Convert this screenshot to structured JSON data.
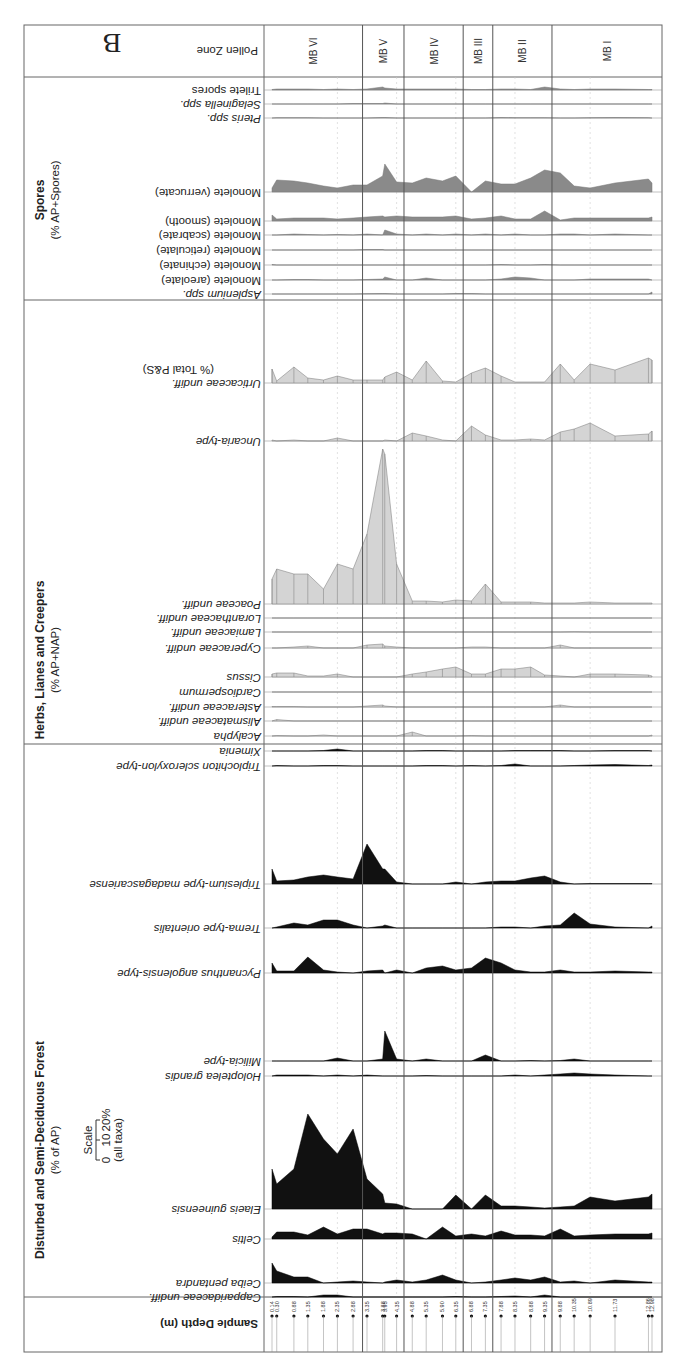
{
  "chart_data": {
    "type": "area",
    "title": "B",
    "subtitle": "Pollen diagram (rendered rotated 180°)",
    "xlabel": "Sample Depth (m)",
    "ylabel": "% abundance",
    "header_label": "Pollen Zone",
    "scale": {
      "label": "Scale",
      "ticks": [
        "0",
        "10",
        "20%"
      ],
      "note": "(all taxa)"
    },
    "depths": [
      0.14,
      0.3,
      0.88,
      1.35,
      1.88,
      2.35,
      2.88,
      3.35,
      3.88,
      3.95,
      4.35,
      4.88,
      5.35,
      5.9,
      6.35,
      6.88,
      7.35,
      7.88,
      8.35,
      8.88,
      9.35,
      9.88,
      10.35,
      10.89,
      11.73,
      12.86,
      12.98
    ],
    "depth_labels": [
      "0.14",
      "0.30",
      "0.88",
      "1.35",
      "1.88",
      "2.35",
      "2.88",
      "3.35",
      "3.88",
      "3.95",
      "4.35",
      "4.88",
      "5.35",
      "5.90",
      "6.35",
      "6.88",
      "7.35",
      "7.88",
      "8.35",
      "8.88",
      "9.35",
      "9.88",
      "10.35",
      "10.89",
      "11.73",
      "12.86",
      "12.98"
    ],
    "zones": [
      {
        "name": "MB VI",
        "from": 0.0,
        "to": 3.2
      },
      {
        "name": "MB V",
        "from": 3.2,
        "to": 4.6
      },
      {
        "name": "MB IV",
        "from": 4.6,
        "to": 6.6
      },
      {
        "name": "MB III",
        "from": 6.6,
        "to": 7.6
      },
      {
        "name": "MB II",
        "from": 7.6,
        "to": 9.6
      },
      {
        "name": "MB I",
        "from": 9.6,
        "to": 13.2
      }
    ],
    "groups": [
      {
        "name": "Spores",
        "basis": "(% AP+Spores)",
        "color": "#8a8a8a"
      },
      {
        "name": "Herbs, Lianes and Creepers",
        "basis": "(% AP+NAP)",
        "color": "#d4d4d4"
      },
      {
        "name": "Disturbed and Semi-Deciduous Forest",
        "basis": "(% of AP)",
        "color": "#111111"
      }
    ],
    "series": [
      {
        "name": "Trilete spores",
        "group": 0,
        "italic": false,
        "baseline": 90,
        "values": [
          0.5,
          1,
          1,
          1,
          0.5,
          1,
          0.5,
          1,
          3,
          2,
          1,
          1,
          1,
          1,
          1,
          0.5,
          0.5,
          1,
          1,
          0.5,
          3,
          1,
          0.5,
          1,
          1,
          0.5,
          0.5
        ]
      },
      {
        "name": "Selaginella spp.",
        "group": 0,
        "italic": true,
        "baseline": 104,
        "values": [
          0,
          0,
          0,
          0,
          0,
          0,
          0.5,
          0.5,
          0.5,
          1,
          0,
          0,
          0,
          0,
          0,
          0,
          0,
          0,
          0,
          0,
          0,
          0,
          0,
          0,
          0,
          0,
          0
        ]
      },
      {
        "name": "Pteris spp.",
        "group": 0,
        "italic": true,
        "baseline": 118,
        "values": [
          0,
          0.3,
          0.3,
          0.3,
          0,
          0,
          0,
          0,
          0.5,
          0.5,
          0,
          0,
          0,
          0,
          0,
          0,
          0,
          0.5,
          0.3,
          0.3,
          0.3,
          0,
          0,
          0.3,
          0.5,
          0.3,
          0
        ]
      },
      {
        "name": "Monolete (verrucate)",
        "group": 0,
        "italic": false,
        "baseline": 192,
        "values": [
          4,
          12,
          11,
          9,
          6,
          4,
          7,
          7,
          16,
          28,
          10,
          9,
          14,
          11,
          16,
          0,
          11,
          8,
          8,
          14,
          22,
          19,
          6,
          4,
          9,
          13,
          9
        ]
      },
      {
        "name": "Monolete (smooth)",
        "group": 0,
        "italic": false,
        "baseline": 221,
        "values": [
          6,
          2,
          3,
          3,
          3,
          2,
          3,
          4,
          5,
          4,
          5,
          4,
          4,
          4,
          5,
          2,
          3,
          5,
          2,
          2,
          10,
          1,
          3,
          3,
          3,
          3,
          4
        ]
      },
      {
        "name": "Monolete (scabrate)",
        "group": 0,
        "italic": false,
        "baseline": 235,
        "values": [
          0,
          0,
          1,
          0.5,
          0,
          0.5,
          0,
          1,
          0,
          5,
          1,
          0,
          1,
          0,
          1,
          0,
          1,
          0,
          1,
          0,
          0,
          1,
          1,
          0,
          1,
          0,
          0
        ]
      },
      {
        "name": "Monolete (reticulate)",
        "group": 0,
        "italic": false,
        "baseline": 250,
        "values": [
          0,
          0,
          0,
          0,
          0,
          0,
          0,
          0.5,
          0.5,
          0,
          0,
          0,
          0,
          0,
          0,
          0,
          0,
          0,
          0,
          0,
          0,
          0,
          0,
          0,
          0,
          0,
          0
        ]
      },
      {
        "name": "Monolete (echinate)",
        "group": 0,
        "italic": false,
        "baseline": 265,
        "values": [
          0.5,
          0,
          0,
          0,
          0,
          0,
          0,
          0,
          0,
          0,
          0,
          0,
          0,
          0,
          0,
          0,
          0,
          0.5,
          0,
          0,
          0.5,
          0,
          0,
          0,
          0,
          0,
          0
        ]
      },
      {
        "name": "Monolete (areolate)",
        "group": 0,
        "italic": false,
        "baseline": 280,
        "values": [
          0,
          0,
          0.5,
          0.5,
          0,
          0,
          0,
          0.5,
          1,
          3,
          0,
          0,
          2,
          0,
          0,
          0,
          0,
          1,
          3,
          2,
          0,
          0,
          0,
          1,
          1,
          1,
          0
        ]
      },
      {
        "name": "Asplenium spp.",
        "group": 0,
        "italic": true,
        "baseline": 294,
        "values": [
          0,
          0,
          0,
          0,
          0,
          0,
          0,
          0.3,
          0.5,
          0.5,
          0,
          0,
          0,
          0,
          0.5,
          0.5,
          0,
          0,
          0,
          0,
          0,
          0,
          0,
          0,
          0,
          0,
          2
        ]
      },
      {
        "name": "Urticaceae undiff.",
        "group": 1,
        "italic": true,
        "basis": "(% Total P&S)",
        "baseline": 383,
        "values": [
          14,
          2,
          16,
          5,
          3,
          7,
          3,
          3,
          3,
          6,
          11,
          3,
          22,
          2,
          1,
          10,
          15,
          7,
          1,
          1,
          1,
          19,
          3,
          19,
          13,
          25,
          23
        ]
      },
      {
        "name": "Uncaria-type",
        "group": 1,
        "italic": true,
        "baseline": 441,
        "values": [
          1,
          0,
          1,
          0,
          0,
          3,
          0,
          0,
          0,
          1,
          0,
          8,
          5,
          1,
          0,
          15,
          6,
          1,
          1,
          2,
          1,
          9,
          12,
          18,
          5,
          7,
          10
        ]
      },
      {
        "name": "Poaceae undiff.",
        "group": 1,
        "italic": true,
        "baseline": 604,
        "values": [
          25,
          35,
          30,
          30,
          15,
          40,
          35,
          70,
          155,
          150,
          40,
          3,
          3,
          2,
          4,
          3,
          20,
          2,
          2,
          2,
          1,
          1,
          1,
          2,
          1,
          1,
          1
        ]
      },
      {
        "name": "Loranthaceae undiff.",
        "group": 1,
        "italic": true,
        "baseline": 618,
        "values": [
          0,
          0,
          0,
          0,
          0,
          0,
          0,
          0,
          0,
          0,
          0,
          0,
          0,
          0,
          0,
          0,
          0,
          0,
          0,
          0,
          0,
          0,
          0,
          0,
          0,
          0,
          0
        ]
      },
      {
        "name": "Lamiaceae undiff.",
        "group": 1,
        "italic": true,
        "baseline": 632,
        "values": [
          0,
          0,
          0,
          0,
          0,
          0,
          0,
          0,
          0,
          0,
          0,
          0,
          0,
          0,
          0,
          0,
          0,
          0,
          0,
          0,
          0,
          0,
          0.3,
          0,
          0,
          0,
          0
        ]
      },
      {
        "name": "Cyperaceae undiff.",
        "group": 1,
        "italic": true,
        "baseline": 648,
        "values": [
          0,
          0,
          1,
          2,
          0,
          0,
          0,
          3,
          4,
          2,
          1,
          0,
          0,
          0,
          0,
          1,
          1,
          0,
          0,
          0,
          0,
          3,
          0,
          0,
          0,
          0,
          0
        ]
      },
      {
        "name": "Cissus",
        "group": 1,
        "italic": true,
        "baseline": 677,
        "values": [
          3,
          4,
          4,
          1,
          1,
          3,
          0,
          0,
          0,
          0,
          0,
          3,
          5,
          8,
          10,
          3,
          3,
          8,
          8,
          10,
          2,
          1,
          0,
          3,
          3,
          2,
          1
        ]
      },
      {
        "name": "Cardiospermum",
        "group": 1,
        "italic": true,
        "baseline": 692,
        "values": [
          0,
          0,
          0,
          0,
          0,
          0,
          0,
          0,
          0,
          0,
          0,
          0,
          0,
          0,
          0,
          0,
          0,
          0,
          0,
          0,
          0,
          0,
          0,
          0,
          0,
          0,
          0
        ]
      },
      {
        "name": "Asteraceae undiff.",
        "group": 1,
        "italic": true,
        "baseline": 707,
        "values": [
          0.5,
          0.5,
          0.5,
          0,
          0,
          0,
          0,
          1,
          2,
          1,
          0,
          0,
          0,
          0,
          0,
          0,
          0,
          0,
          0,
          0,
          0,
          2,
          0,
          0,
          0,
          0,
          0
        ]
      },
      {
        "name": "Alismataceae undiff.",
        "group": 1,
        "italic": true,
        "baseline": 721,
        "values": [
          0,
          1.5,
          0,
          0,
          0,
          0,
          0,
          0,
          0,
          0,
          0,
          0,
          0,
          0,
          0,
          0,
          0,
          0,
          0,
          0,
          0,
          0,
          0,
          0,
          0,
          0,
          0
        ]
      },
      {
        "name": "Acalypha",
        "group": 1,
        "italic": true,
        "baseline": 736,
        "values": [
          0,
          0.5,
          0,
          0,
          1,
          0,
          0,
          0,
          0,
          0,
          0,
          4,
          0,
          0,
          0,
          0.5,
          0,
          0,
          0,
          0,
          0,
          0,
          0,
          0,
          0,
          0,
          1
        ]
      },
      {
        "name": "Ximenia",
        "group": 2,
        "italic": true,
        "baseline": 751,
        "values": [
          0,
          0,
          0,
          0,
          0.5,
          2,
          0,
          0,
          0,
          0,
          0,
          0,
          0.5,
          0.5,
          0,
          0,
          0,
          0,
          0.5,
          0.5,
          0.5,
          0.5,
          0,
          0,
          0.5,
          0.5,
          0
        ]
      },
      {
        "name": "Triplochiton scleroxylon-type",
        "group": 2,
        "italic": true,
        "baseline": 766,
        "values": [
          0,
          0.5,
          0,
          0,
          0.5,
          0.5,
          0,
          0,
          0,
          0,
          0,
          0,
          0.5,
          0.5,
          0,
          0.5,
          0,
          0.5,
          2,
          0,
          0,
          0,
          0.5,
          1,
          1.5,
          0.5,
          1
        ]
      },
      {
        "name": "Triplesium-type madagascariense",
        "group": 2,
        "italic": true,
        "baseline": 884,
        "values": [
          15,
          3,
          4,
          7,
          9,
          7,
          5,
          40,
          15,
          15,
          2,
          0,
          0,
          0,
          2,
          0,
          2,
          3,
          3,
          6,
          8,
          2,
          0,
          0.5,
          0.5,
          0.5,
          0.5
        ]
      },
      {
        "name": "Trema-type orientalis",
        "group": 2,
        "italic": true,
        "baseline": 928,
        "values": [
          0,
          1,
          5,
          3,
          8,
          8,
          3,
          0,
          2,
          3,
          0,
          0,
          0,
          0,
          0,
          0,
          0,
          1,
          1,
          0,
          2,
          3,
          15,
          4,
          1,
          0,
          2
        ]
      },
      {
        "name": "Pycnanthus angolensis-type",
        "group": 2,
        "italic": true,
        "baseline": 973,
        "values": [
          10,
          2,
          2,
          16,
          3,
          1,
          0,
          2,
          3,
          0,
          3,
          0,
          5,
          7,
          3,
          5,
          15,
          10,
          3,
          1,
          1,
          3,
          1,
          1,
          2,
          1,
          1
        ]
      },
      {
        "name": "Milicia-type",
        "group": 2,
        "italic": true,
        "baseline": 1061,
        "values": [
          0,
          0,
          0,
          0,
          0,
          3,
          0,
          0,
          2,
          30,
          2,
          0,
          2,
          0,
          0,
          0,
          6,
          0,
          0,
          0.5,
          0,
          0.5,
          2,
          0,
          0,
          0,
          0
        ]
      },
      {
        "name": "Holoptelea grandis",
        "group": 2,
        "italic": true,
        "baseline": 1076,
        "values": [
          0,
          1,
          1,
          1,
          0,
          1,
          0,
          1,
          0,
          0,
          0,
          0,
          0.5,
          0,
          0,
          0,
          0,
          0,
          1,
          0,
          1,
          2,
          3,
          2,
          1,
          0,
          0
        ]
      },
      {
        "name": "Elaeis guineensis",
        "group": 2,
        "italic": true,
        "baseline": 1209,
        "values": [
          40,
          25,
          40,
          95,
          70,
          55,
          80,
          30,
          15,
          6,
          5,
          0,
          0,
          0,
          14,
          0,
          14,
          3,
          3,
          2,
          1,
          2,
          3,
          12,
          8,
          12,
          15
        ]
      },
      {
        "name": "Celtis",
        "group": 2,
        "italic": true,
        "baseline": 1239,
        "values": [
          2,
          7,
          7,
          4,
          12,
          5,
          10,
          10,
          5,
          6,
          6,
          5,
          0,
          12,
          3,
          5,
          3,
          8,
          4,
          4,
          3,
          10,
          3,
          4,
          5,
          5,
          6
        ]
      },
      {
        "name": "Ceiba pentandra",
        "group": 2,
        "italic": true,
        "baseline": 1283,
        "values": [
          20,
          12,
          6,
          6,
          0,
          1,
          2,
          1,
          0,
          1,
          3,
          1,
          3,
          8,
          3,
          0,
          1,
          3,
          5,
          3,
          6,
          1,
          2,
          0,
          3,
          1,
          1
        ]
      },
      {
        "name": "Capparidaceae undiff.",
        "group": 2,
        "italic": true,
        "baseline": 1297,
        "values": [
          0,
          0.5,
          0.5,
          0,
          2,
          2,
          0,
          0,
          0,
          0,
          0,
          0,
          0,
          0,
          0.5,
          0,
          0,
          0.5,
          1,
          0,
          2,
          0,
          0,
          0,
          0,
          0,
          0
        ]
      }
    ]
  }
}
